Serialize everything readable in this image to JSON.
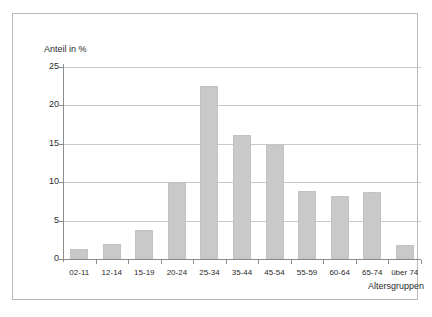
{
  "chart_data": {
    "type": "bar",
    "title": "",
    "subtitle": "",
    "xlabel": "Altersgruppen",
    "ylabel": "Anteil in %",
    "categories": [
      "02-11",
      "12-14",
      "15-19",
      "20-24",
      "25-34",
      "35-44",
      "45-54",
      "55-59",
      "60-64",
      "65-74",
      "über 74"
    ],
    "values": [
      1.3,
      2.0,
      3.8,
      10.0,
      22.5,
      16.1,
      14.8,
      8.8,
      8.2,
      8.7,
      1.8
    ],
    "ylim": [
      0,
      25
    ],
    "yticks": [
      0,
      5,
      10,
      15,
      20,
      25
    ],
    "ytick_labels": [
      "0",
      "5",
      "10",
      "15",
      "20",
      "25"
    ],
    "grid": true,
    "legend": false,
    "legend_position": "none",
    "bar_color": "#c9c9c9",
    "grid_color": "#c9c9c9",
    "axis_color": "#8d8d8d",
    "frame_color": "#b9b9b9",
    "background": "#ffffff"
  }
}
